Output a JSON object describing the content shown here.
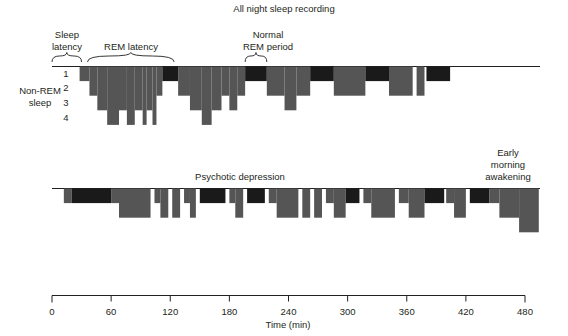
{
  "figure": {
    "title": "All night sleep recording",
    "axis_label": "Time (min)",
    "stage_axis_label_line1": "Non-REM",
    "stage_axis_label_line2": "sleep",
    "stage_labels": [
      "1",
      "2",
      "3",
      "4"
    ],
    "annotations": {
      "sleep_latency_line1": "Sleep",
      "sleep_latency_line2": "latency",
      "rem_latency": "REM latency",
      "normal": "Normal",
      "rem_period": "REM period",
      "psychotic_depression": "Psychotic depression",
      "early_line1": "Early",
      "early_line2": "morning",
      "early_line3": "awakening"
    },
    "colors": {
      "nonrem": "#555555",
      "rem": "#1a1a1a",
      "axis": "#231f20",
      "background": "#ffffff"
    }
  },
  "chart_data": {
    "type": "bar",
    "title": "All night sleep recording",
    "xlabel": "Time (min)",
    "ylabel": "Non-REM sleep",
    "xlim": [
      0,
      480
    ],
    "xticks": [
      0,
      60,
      120,
      180,
      240,
      300,
      360,
      420,
      480
    ],
    "xtick_labels": [
      "0",
      "60",
      "120",
      "180",
      "240",
      "300",
      "360",
      "420",
      "480"
    ],
    "ylim": [
      0,
      4
    ],
    "yticks": [
      1,
      2,
      3,
      4
    ],
    "grid": false,
    "legend_position": "none",
    "series": [
      {
        "name": "Normal",
        "panel": "top",
        "note": "Normal all-night sleep: long sleep latency, long REM latency, deep stage 3-4 early, REM periods lengthen toward morning",
        "segments": [
          {
            "start": 28,
            "end": 38,
            "stage": 1,
            "type": "nonrem"
          },
          {
            "start": 38,
            "end": 46,
            "stage": 2,
            "type": "nonrem"
          },
          {
            "start": 46,
            "end": 56,
            "stage": 3,
            "type": "nonrem"
          },
          {
            "start": 56,
            "end": 68,
            "stage": 4,
            "type": "nonrem"
          },
          {
            "start": 68,
            "end": 76,
            "stage": 3,
            "type": "nonrem"
          },
          {
            "start": 76,
            "end": 84,
            "stage": 4,
            "type": "nonrem"
          },
          {
            "start": 84,
            "end": 92,
            "stage": 3,
            "type": "nonrem"
          },
          {
            "start": 92,
            "end": 96,
            "stage": 4,
            "type": "nonrem"
          },
          {
            "start": 96,
            "end": 102,
            "stage": 3,
            "type": "nonrem"
          },
          {
            "start": 102,
            "end": 106,
            "stage": 4,
            "type": "nonrem"
          },
          {
            "start": 106,
            "end": 112,
            "stage": 2,
            "type": "nonrem"
          },
          {
            "start": 112,
            "end": 128,
            "stage": 1,
            "type": "rem"
          },
          {
            "start": 128,
            "end": 140,
            "stage": 2,
            "type": "nonrem"
          },
          {
            "start": 140,
            "end": 152,
            "stage": 3,
            "type": "nonrem"
          },
          {
            "start": 152,
            "end": 162,
            "stage": 4,
            "type": "nonrem"
          },
          {
            "start": 162,
            "end": 172,
            "stage": 3,
            "type": "nonrem"
          },
          {
            "start": 172,
            "end": 180,
            "stage": 2,
            "type": "nonrem"
          },
          {
            "start": 180,
            "end": 188,
            "stage": 3,
            "type": "nonrem"
          },
          {
            "start": 188,
            "end": 196,
            "stage": 2,
            "type": "nonrem"
          },
          {
            "start": 196,
            "end": 218,
            "stage": 1,
            "type": "rem"
          },
          {
            "start": 218,
            "end": 236,
            "stage": 2,
            "type": "nonrem"
          },
          {
            "start": 236,
            "end": 248,
            "stage": 3,
            "type": "nonrem"
          },
          {
            "start": 248,
            "end": 262,
            "stage": 2,
            "type": "nonrem"
          },
          {
            "start": 262,
            "end": 286,
            "stage": 1,
            "type": "rem"
          },
          {
            "start": 286,
            "end": 318,
            "stage": 2,
            "type": "nonrem"
          },
          {
            "start": 318,
            "end": 342,
            "stage": 1,
            "type": "rem"
          },
          {
            "start": 342,
            "end": 366,
            "stage": 2,
            "type": "nonrem"
          },
          {
            "start": 370,
            "end": 378,
            "stage": 2,
            "type": "nonrem"
          },
          {
            "start": 380,
            "end": 404,
            "stage": 1,
            "type": "rem"
          }
        ]
      },
      {
        "name": "Psychotic depression",
        "panel": "bottom",
        "note": "Psychotic depression: short sleep latency, very short REM latency with early REM onset, fragmented sleep, little stage 3-4, early morning awakening",
        "segments": [
          {
            "start": 12,
            "end": 20,
            "stage": 1,
            "type": "nonrem"
          },
          {
            "start": 20,
            "end": 60,
            "stage": 1,
            "type": "rem"
          },
          {
            "start": 60,
            "end": 68,
            "stage": 1,
            "type": "nonrem"
          },
          {
            "start": 68,
            "end": 100,
            "stage": 2,
            "type": "nonrem"
          },
          {
            "start": 104,
            "end": 110,
            "stage": 1,
            "type": "nonrem"
          },
          {
            "start": 110,
            "end": 118,
            "stage": 2,
            "type": "nonrem"
          },
          {
            "start": 122,
            "end": 130,
            "stage": 2,
            "type": "nonrem"
          },
          {
            "start": 134,
            "end": 140,
            "stage": 1,
            "type": "nonrem"
          },
          {
            "start": 140,
            "end": 146,
            "stage": 2,
            "type": "nonrem"
          },
          {
            "start": 150,
            "end": 176,
            "stage": 1,
            "type": "rem"
          },
          {
            "start": 180,
            "end": 186,
            "stage": 1,
            "type": "nonrem"
          },
          {
            "start": 186,
            "end": 194,
            "stage": 2,
            "type": "nonrem"
          },
          {
            "start": 198,
            "end": 216,
            "stage": 1,
            "type": "rem"
          },
          {
            "start": 220,
            "end": 228,
            "stage": 1,
            "type": "nonrem"
          },
          {
            "start": 228,
            "end": 250,
            "stage": 2,
            "type": "nonrem"
          },
          {
            "start": 254,
            "end": 262,
            "stage": 2,
            "type": "nonrem"
          },
          {
            "start": 266,
            "end": 274,
            "stage": 2,
            "type": "nonrem"
          },
          {
            "start": 278,
            "end": 286,
            "stage": 1,
            "type": "nonrem"
          },
          {
            "start": 286,
            "end": 298,
            "stage": 2,
            "type": "nonrem"
          },
          {
            "start": 298,
            "end": 312,
            "stage": 1,
            "type": "rem"
          },
          {
            "start": 316,
            "end": 324,
            "stage": 1,
            "type": "nonrem"
          },
          {
            "start": 324,
            "end": 348,
            "stage": 2,
            "type": "nonrem"
          },
          {
            "start": 352,
            "end": 362,
            "stage": 1,
            "type": "nonrem"
          },
          {
            "start": 362,
            "end": 378,
            "stage": 2,
            "type": "nonrem"
          },
          {
            "start": 378,
            "end": 398,
            "stage": 1,
            "type": "rem"
          },
          {
            "start": 400,
            "end": 408,
            "stage": 1,
            "type": "nonrem"
          },
          {
            "start": 408,
            "end": 420,
            "stage": 2,
            "type": "nonrem"
          },
          {
            "start": 424,
            "end": 444,
            "stage": 1,
            "type": "rem"
          },
          {
            "start": 444,
            "end": 454,
            "stage": 1,
            "type": "nonrem"
          },
          {
            "start": 454,
            "end": 474,
            "stage": 2,
            "type": "nonrem"
          },
          {
            "start": 474,
            "end": 494,
            "stage": 3,
            "type": "nonrem"
          }
        ]
      }
    ],
    "annotations": [
      {
        "text": "Sleep latency",
        "x_start": 0,
        "x_end": 30,
        "type": "bracket",
        "panel": "top"
      },
      {
        "text": "REM latency",
        "x_start": 36,
        "x_end": 124,
        "type": "bracket",
        "panel": "top"
      },
      {
        "text": "REM period",
        "x_start": 196,
        "x_end": 218,
        "type": "bracket",
        "panel": "top"
      },
      {
        "text": "Psychotic depression",
        "x": 240,
        "type": "label",
        "panel": "bottom"
      },
      {
        "text": "Early morning awakening",
        "x": 450,
        "type": "label",
        "panel": "bottom"
      }
    ]
  }
}
